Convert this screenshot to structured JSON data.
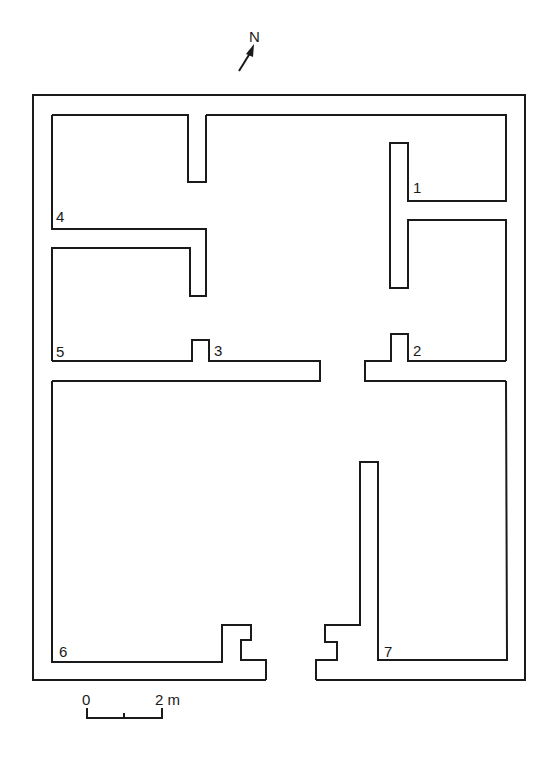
{
  "figure": {
    "type": "architectural floor plan",
    "north_arrow": {
      "label": "N",
      "icon": "north-arrow-icon"
    },
    "room_labels": [
      {
        "id": "1",
        "text": "1",
        "x": 413,
        "y": 193
      },
      {
        "id": "2",
        "text": "2",
        "x": 413,
        "y": 355
      },
      {
        "id": "3",
        "text": "3",
        "x": 214,
        "y": 355
      },
      {
        "id": "4",
        "text": "4",
        "x": 56,
        "y": 221
      },
      {
        "id": "5",
        "text": "5",
        "x": 56,
        "y": 356
      },
      {
        "id": "6",
        "text": "6",
        "x": 58,
        "y": 656
      },
      {
        "id": "7",
        "text": "7",
        "x": 384,
        "y": 656
      }
    ],
    "scale_bar": {
      "start_label": "0",
      "end_label": "2 m",
      "length_m": 2,
      "midtick": true
    },
    "colors": {
      "line": "#1a1a1a",
      "background": "#ffffff"
    }
  }
}
